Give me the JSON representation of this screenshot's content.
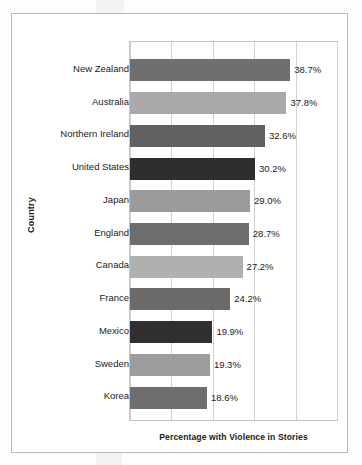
{
  "chart_data": {
    "type": "bar",
    "orientation": "horizontal",
    "title": "",
    "xlabel": "Percentage with Violence in Stories",
    "ylabel": "Country",
    "categories": [
      "New Zealand",
      "Australia",
      "Northern Ireland",
      "United States",
      "Japan",
      "England",
      "Canada",
      "France",
      "Mexico",
      "Sweden",
      "Korea"
    ],
    "values": [
      38.7,
      37.8,
      32.6,
      30.2,
      29.0,
      28.7,
      27.2,
      24.2,
      19.9,
      19.3,
      18.6
    ],
    "value_labels": [
      "38.7%",
      "37.8%",
      "32.6%",
      "30.2%",
      "29.0%",
      "28.7%",
      "27.2%",
      "24.2%",
      "19.9%",
      "19.3%",
      "18.6%"
    ],
    "bar_colors": [
      "#6f6f6f",
      "#a9a9a9",
      "#616161",
      "#2e2e2e",
      "#9b9b9b",
      "#6d6d6d",
      "#b0b0b0",
      "#6a6a6a",
      "#2f2f2f",
      "#9d9d9d",
      "#6e6e6e"
    ],
    "xlim": [
      0,
      50
    ],
    "gridline_values": [
      0,
      10,
      20,
      30,
      40,
      50
    ],
    "grid": true,
    "legend": "none"
  }
}
